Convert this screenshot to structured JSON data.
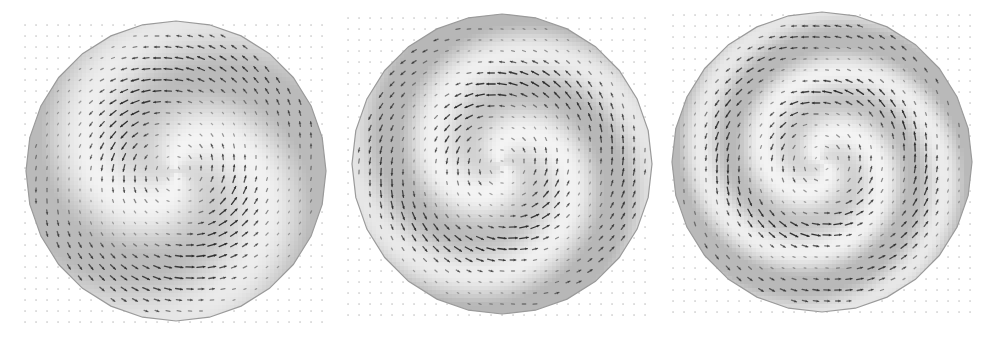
{
  "figure": {
    "width": 999,
    "height": 341,
    "background": "#ffffff",
    "grid_dot_color": "#b8b8b8",
    "arrow_color": "#2a2a2a",
    "disk_edge_color": "#9a9a9a",
    "grid_spacing": 11,
    "panels": [
      {
        "id": "panel-1",
        "description": "two-arm spiral vector field, loosely wound",
        "grid_x0": 25,
        "grid_y0": 25,
        "grid_x1": 325,
        "grid_y1": 325,
        "disk_cx": 176,
        "disk_cy": 171,
        "disk_r": 150,
        "winding": 1.1,
        "arms": 2,
        "phase": 0.6,
        "shade_light": "#f4f4f4",
        "shade_dark": "#b4b4b4"
      },
      {
        "id": "panel-2",
        "description": "two-arm spiral vector field, medium winding",
        "grid_x0": 348,
        "grid_y0": 18,
        "grid_x1": 652,
        "grid_y1": 318,
        "disk_cx": 502,
        "disk_cy": 164,
        "disk_r": 150,
        "winding": 1.7,
        "arms": 2,
        "phase": 1.4,
        "shade_light": "#f4f4f4",
        "shade_dark": "#b0b0b0"
      },
      {
        "id": "panel-3",
        "description": "two-arm spiral vector field, tightly wound",
        "grid_x0": 673,
        "grid_y0": 15,
        "grid_x1": 975,
        "grid_y1": 315,
        "disk_cx": 822,
        "disk_cy": 162,
        "disk_r": 150,
        "winding": 2.3,
        "arms": 2,
        "phase": 2.2,
        "shade_light": "#f4f4f4",
        "shade_dark": "#b2b2b2"
      }
    ]
  }
}
